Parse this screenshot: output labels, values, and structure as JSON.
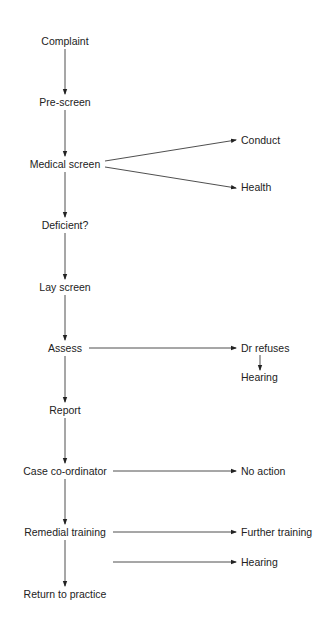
{
  "diagram": {
    "type": "flowchart",
    "line_color": "#222222",
    "main_flow": [
      {
        "id": "complaint",
        "label": "Complaint"
      },
      {
        "id": "prescreen",
        "label": "Pre-screen"
      },
      {
        "id": "medical",
        "label": "Medical screen"
      },
      {
        "id": "deficient",
        "label": "Deficient?"
      },
      {
        "id": "layscreen",
        "label": "Lay screen"
      },
      {
        "id": "assess",
        "label": "Assess"
      },
      {
        "id": "report",
        "label": "Report"
      },
      {
        "id": "casecoord",
        "label": "Case co-ordinator"
      },
      {
        "id": "remedial",
        "label": "Remedial training"
      },
      {
        "id": "return",
        "label": "Return to practice"
      }
    ],
    "branches": [
      {
        "id": "conduct",
        "label": "Conduct",
        "from": "medical"
      },
      {
        "id": "health",
        "label": "Health",
        "from": "medical"
      },
      {
        "id": "drrefuses",
        "label": "Dr refuses",
        "from": "assess"
      },
      {
        "id": "hearing1",
        "label": "Hearing",
        "from": "drrefuses"
      },
      {
        "id": "noaction",
        "label": "No action",
        "from": "casecoord"
      },
      {
        "id": "further",
        "label": "Further training",
        "from": "remedial"
      },
      {
        "id": "hearing2",
        "label": "Hearing",
        "from": "remedial"
      }
    ]
  }
}
